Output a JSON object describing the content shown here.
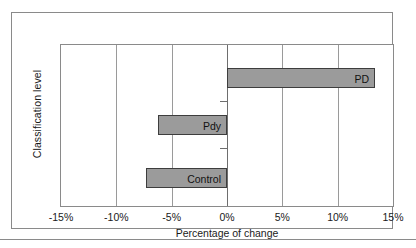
{
  "figure": {
    "background_color": "#ffffff",
    "frame_color": "#8a8a8a",
    "bar_fill_color": "#9b9b9b",
    "bar_edge_color": "#3d3d3d",
    "gridline_color": "#9a9a9a"
  },
  "chart_data": {
    "type": "bar",
    "orientation": "horizontal",
    "title": "",
    "xlabel": "Percentage of change",
    "ylabel": "Classification level",
    "categories": [
      "PD",
      "Pdy",
      "Control"
    ],
    "values": [
      13.4,
      -6.2,
      -7.3
    ],
    "value_labels": [
      "PD",
      "Pdy",
      "Control"
    ],
    "xlim": [
      -15,
      15
    ],
    "xticks": [
      -15,
      -10,
      -5,
      0,
      5,
      10,
      15
    ],
    "xtick_labels": [
      "-15%",
      "-10%",
      "-5%",
      "0%",
      "5%",
      "10%",
      "15%"
    ],
    "grid": true,
    "legend": null,
    "note": "Bar labels are drawn inside each bar at its inner edge; category names double as data labels."
  }
}
